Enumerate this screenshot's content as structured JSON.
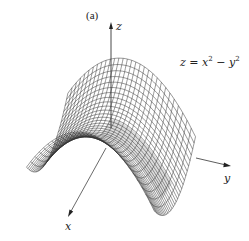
{
  "figure": {
    "panel_label": "(a)",
    "equation": {
      "lhs": "z",
      "eq": " = ",
      "term1_base": "x",
      "term1_exp": "2",
      "op": " − ",
      "term2_base": "y",
      "term2_exp": "2"
    },
    "axes": {
      "x_label": "x",
      "y_label": "y",
      "z_label": "z"
    },
    "surface": {
      "function": "z = x^2 - y^2",
      "type": "saddle (hyperbolic paraboloid) wireframe mesh",
      "grid_lines_u": 30,
      "grid_lines_v": 30,
      "line_color": "#333333",
      "shadow_color": "#9a9a9a"
    }
  }
}
